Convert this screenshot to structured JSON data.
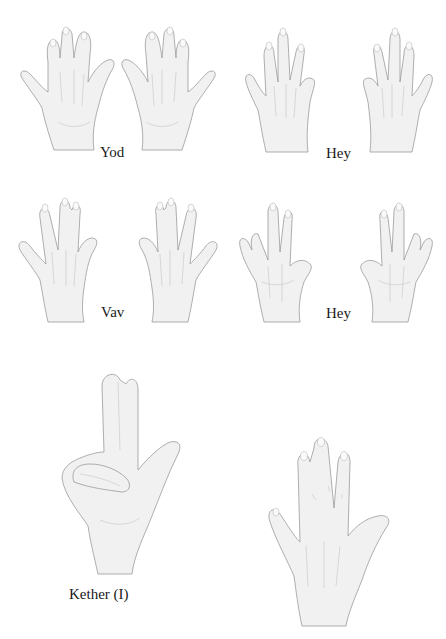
{
  "page": {
    "background": "#ffffff",
    "header_sliver": "· · · · ·"
  },
  "figures": [
    {
      "id": "yod",
      "caption": "Yod",
      "hands": [
        "left-back",
        "right-back"
      ],
      "description": "Two hands, backs facing viewer, fingers spread with middle and ring pairs joined"
    },
    {
      "id": "hey-1",
      "caption": "Hey",
      "hands": [
        "left-back",
        "right-back"
      ],
      "description": "Two hands, backs facing viewer, little finger tucked behind"
    },
    {
      "id": "vav",
      "caption": "Vav",
      "hands": [
        "left-back",
        "right-back"
      ],
      "description": "Two hands, backs facing viewer, fingers spread in pairs"
    },
    {
      "id": "hey-2",
      "caption": "Hey",
      "hands": [
        "left-palm",
        "right-palm"
      ],
      "description": "Two hands, palms facing viewer, fingers spread"
    },
    {
      "id": "kether",
      "caption": "Kether (I)",
      "hands": [
        "single-gesture"
      ],
      "description": "Single hand with index and middle fingers raised, ring and little fingers folded, thumb extended"
    },
    {
      "id": "single-hand",
      "caption": "",
      "hands": [
        "single-back"
      ],
      "description": "Single hand, back facing viewer, fingers spread with middle and ring joined"
    }
  ],
  "colors": {
    "ink": "#1a1a1a",
    "sketch_outline": "#9a9a9a",
    "sketch_fill": "#f1f1f1",
    "sketch_shade": "#c4c4c4"
  }
}
